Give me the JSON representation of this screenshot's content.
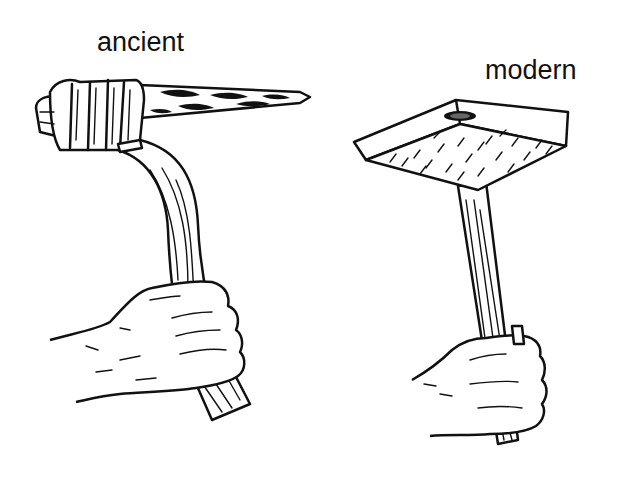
{
  "figure": {
    "left_panel": {
      "label": "ancient",
      "depiction": "stone-axe-with-bound-head-held-in-hand"
    },
    "right_panel": {
      "label": "modern",
      "depiction": "metal-hammer-with-wooden-handle-held-in-hand"
    },
    "colors": {
      "ink": "#111111",
      "background": "#ffffff"
    }
  }
}
